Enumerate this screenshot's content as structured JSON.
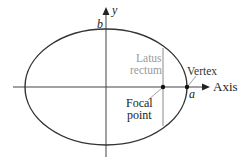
{
  "diagram": {
    "colors": {
      "curve": "#333333",
      "axis": "#444444",
      "latus_line": "#8a8a8a",
      "latus_text": "#9a9a9a",
      "text": "#222222"
    },
    "labels": {
      "y_axis": "y",
      "x_axis": "Axis",
      "b": "b",
      "a": "a",
      "latus_line1": "Latus",
      "latus_line2": "rectum",
      "vertex": "Vertex",
      "focal_line1": "Focal",
      "focal_line2": "point"
    }
  }
}
